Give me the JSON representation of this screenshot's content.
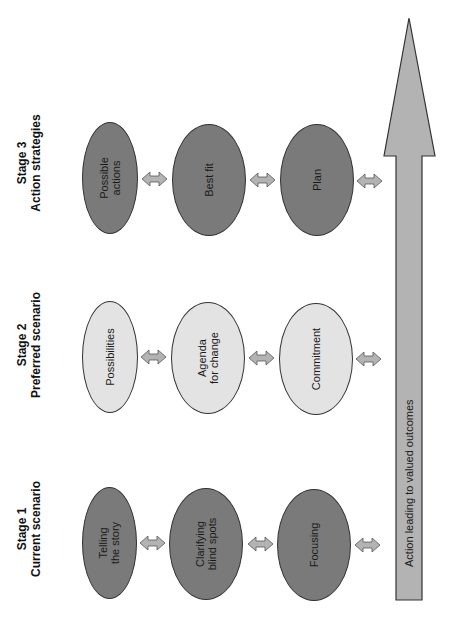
{
  "stages": [
    {
      "title": "Stage 3",
      "subtitle": "Action strategies",
      "style": "dark",
      "items": [
        "Possible\nactions",
        "Best fit",
        "Plan"
      ]
    },
    {
      "title": "Stage 2",
      "subtitle": "Preferred scenario",
      "style": "light",
      "items": [
        "Possibilities",
        "Agenda\nfor change",
        "Commitment"
      ]
    },
    {
      "title": "Stage 1",
      "subtitle": "Current scenario",
      "style": "dark",
      "items": [
        "Telling\nthe story",
        "Clarifying\nblind spots",
        "Focusing"
      ]
    }
  ],
  "big_arrow": {
    "label": "Action leading to valued outcomes"
  },
  "colors": {
    "dark_fill": "#7a7a7a",
    "light_fill": "#e3e3e3",
    "arrow_fill": "#b3b3b3",
    "outline": "#333333"
  }
}
